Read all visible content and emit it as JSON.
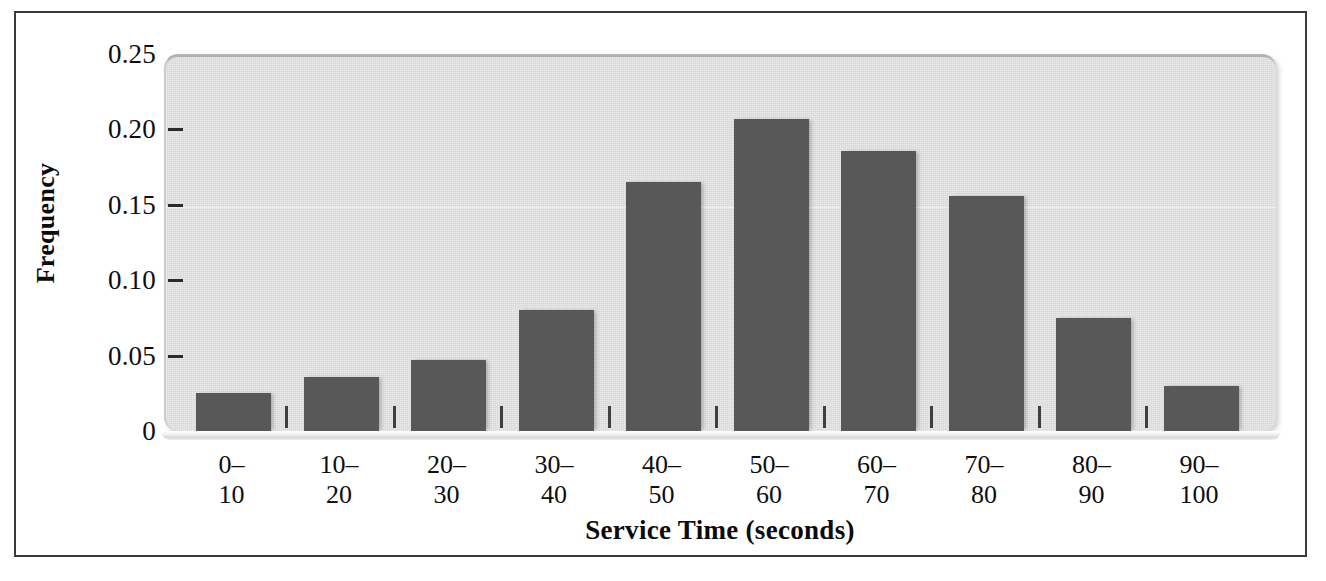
{
  "chart_data": {
    "type": "bar",
    "title": "",
    "subtitle": "",
    "xlabel": "Service Time (seconds)",
    "ylabel": "Frequency",
    "categories": [
      "0–10",
      "10–20",
      "20–30",
      "30–40",
      "40–50",
      "50–60",
      "60–70",
      "70–80",
      "80–90",
      "90–100"
    ],
    "category_lines": [
      {
        "top": "0–",
        "bottom": "10"
      },
      {
        "top": "10–",
        "bottom": "20"
      },
      {
        "top": "20–",
        "bottom": "30"
      },
      {
        "top": "30–",
        "bottom": "40"
      },
      {
        "top": "40–",
        "bottom": "50"
      },
      {
        "top": "50–",
        "bottom": "60"
      },
      {
        "top": "60–",
        "bottom": "70"
      },
      {
        "top": "70–",
        "bottom": "80"
      },
      {
        "top": "80–",
        "bottom": "90"
      },
      {
        "top": "90–",
        "bottom": "100"
      }
    ],
    "values": [
      0.025,
      0.036,
      0.047,
      0.08,
      0.165,
      0.207,
      0.186,
      0.156,
      0.075,
      0.03
    ],
    "ylim": [
      0,
      0.25
    ],
    "xlim_categories": 10,
    "yticks": [
      0,
      0.05,
      0.1,
      0.15,
      0.2,
      0.25
    ],
    "ytick_labels": [
      "0",
      "0.05",
      "0.10",
      "0.15",
      "0.20",
      "0.25"
    ],
    "grid": false,
    "legend": null,
    "legend_position": "none",
    "bar_color": "#585858",
    "plot_background_color": "#dddddd",
    "figure_background_color": "#ffffff",
    "frame_color": "#3a3a3a",
    "text_color": "#0e0e0e"
  },
  "axes": {
    "y_title": "Frequency",
    "x_title": "Service Time (seconds)"
  }
}
